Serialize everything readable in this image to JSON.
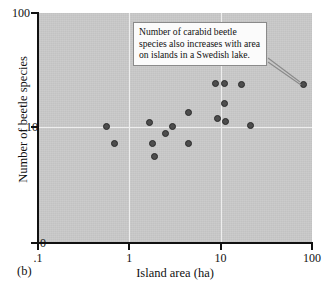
{
  "figure": {
    "panel_tag": "(b)",
    "annotation": "Number of carabid beetle species also increases with area on islands in a Swedish lake.",
    "background_color": "#c9c9c9",
    "gridline_color": "#eeeeee",
    "marker_color": "#4d4d4d",
    "axis_color": "#111111"
  },
  "chart_data": {
    "type": "scatter",
    "title": "",
    "xlabel": "Island area (ha)",
    "ylabel": "Number of beetle species",
    "xscale": "log",
    "yscale": "log",
    "xlim": [
      0.1,
      100
    ],
    "ylim": [
      1,
      100
    ],
    "grid": true,
    "legend": null,
    "xticklabels": [
      ".1",
      "1",
      "10",
      "100"
    ],
    "xtickvalues": [
      0.1,
      1,
      10,
      100
    ],
    "yticklabels": [
      "0",
      "10",
      "100"
    ],
    "ytickvalues": [
      1,
      10,
      100
    ],
    "annotations": [
      {
        "text": "Number of carabid beetle species also increases with area on islands in a Swedish lake.",
        "points_to_x": 80,
        "points_to_y": 23.5
      }
    ],
    "points": [
      {
        "x": 0.56,
        "y": 10.2
      },
      {
        "x": 0.68,
        "y": 7.2
      },
      {
        "x": 1.65,
        "y": 11.0
      },
      {
        "x": 1.8,
        "y": 7.2
      },
      {
        "x": 1.9,
        "y": 5.5
      },
      {
        "x": 2.5,
        "y": 8.8
      },
      {
        "x": 3.0,
        "y": 10.1
      },
      {
        "x": 4.4,
        "y": 7.2
      },
      {
        "x": 4.5,
        "y": 13.5
      },
      {
        "x": 8.8,
        "y": 24.0
      },
      {
        "x": 9.2,
        "y": 11.8
      },
      {
        "x": 11.0,
        "y": 24.0
      },
      {
        "x": 11.0,
        "y": 16.0
      },
      {
        "x": 11.2,
        "y": 11.2
      },
      {
        "x": 17.0,
        "y": 23.5
      },
      {
        "x": 21.0,
        "y": 10.3
      },
      {
        "x": 80.0,
        "y": 23.5
      }
    ]
  }
}
